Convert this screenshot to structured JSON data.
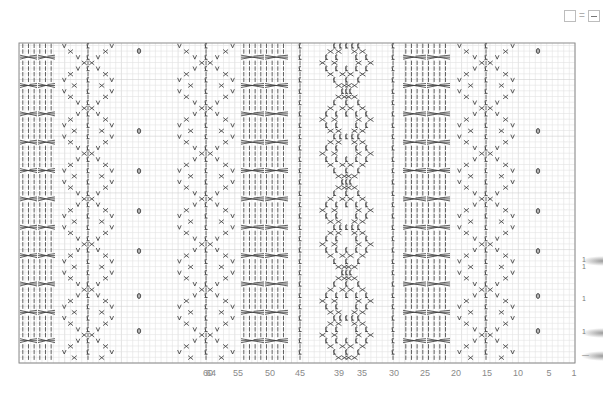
{
  "legend": {
    "symbol_left": "empty-square",
    "equals": "=",
    "symbol_right": "dash-square",
    "meaning": "empty square = knit (dash)"
  },
  "chart": {
    "type": "knitting-chart",
    "columns_visible_labels": [
      "64",
      "60",
      "55",
      "50",
      "45",
      "39",
      "35",
      "30",
      "25",
      "20",
      "15",
      "10",
      "5",
      "1"
    ],
    "tick_x": [
      211,
      208,
      238,
      270,
      300,
      339,
      362,
      394,
      425,
      456,
      487,
      518,
      549,
      574
    ],
    "grid": {
      "left": 19,
      "top": 43,
      "right": 575,
      "bottom": 363,
      "cell": 5.67
    },
    "colors": {
      "grid_line": "#e3e3e3",
      "grid_major": "#d0d0d0",
      "border": "#8c8c8c",
      "symbol": "#3a3a3a",
      "tick_text": "#8a8a8a"
    },
    "panels": [
      {
        "name": "cable-panel-left",
        "x": 20,
        "w": 36,
        "kind": "cable"
      },
      {
        "name": "lace-diamond-left",
        "x": 63,
        "w": 50,
        "kind": "lace"
      },
      {
        "name": "bobble-col-left",
        "x": 139,
        "kind": "bobble"
      },
      {
        "name": "lace-diamond-mid",
        "x": 178,
        "w": 56,
        "kind": "lace"
      },
      {
        "name": "cable-panel-mid",
        "x": 241,
        "w": 48,
        "kind": "cable"
      },
      {
        "name": "twisted-rib-left",
        "x": 300,
        "kind": "twist"
      },
      {
        "name": "twisted-stitch-panel",
        "x": 308,
        "w": 77,
        "kind": "travel"
      },
      {
        "name": "twisted-rib-right",
        "x": 393,
        "kind": "twist"
      },
      {
        "name": "cable-panel-right",
        "x": 403,
        "w": 48,
        "kind": "cable"
      },
      {
        "name": "lace-diamond-right",
        "x": 458,
        "w": 56,
        "kind": "lace"
      },
      {
        "name": "bobble-col-right",
        "x": 538,
        "kind": "bobble"
      }
    ],
    "bobble_rows_y": [
      51,
      131,
      171,
      211,
      251,
      296,
      331
    ],
    "side_marks": [
      {
        "label": "1",
        "y": 261
      },
      {
        "label": "1",
        "y": 268
      },
      {
        "label": "1",
        "y": 300
      },
      {
        "label": "1",
        "y": 333
      },
      {
        "label": "—",
        "y": 356
      }
    ]
  }
}
